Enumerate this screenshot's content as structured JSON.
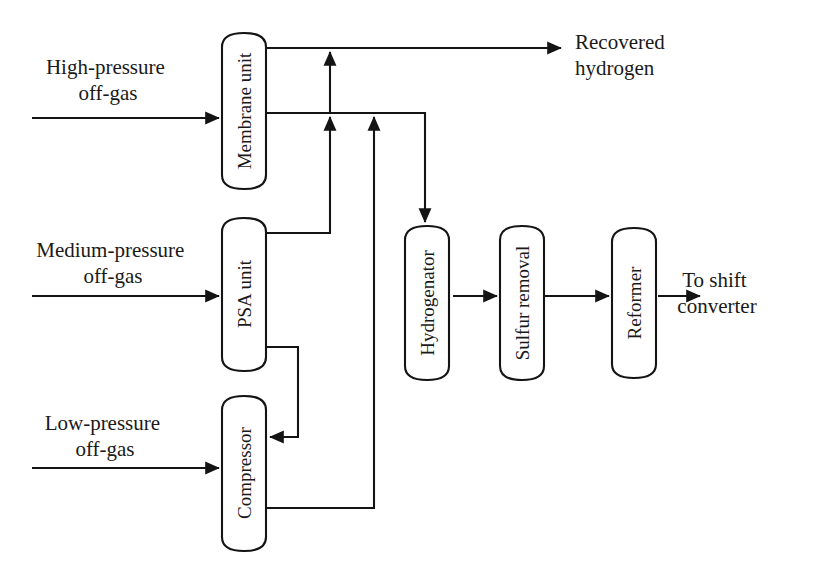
{
  "diagram": {
    "background_color": "#ffffff",
    "line_color": "#141414",
    "text_color": "#1a1a1a"
  },
  "vessels": [
    {
      "id": "membrane-unit",
      "label": "Membrane unit",
      "x": 222,
      "y": 33,
      "w": 44,
      "h": 156
    },
    {
      "id": "psa-unit",
      "label": "PSA unit",
      "x": 222,
      "y": 218,
      "w": 44,
      "h": 153
    },
    {
      "id": "compressor",
      "label": "Compressor",
      "x": 222,
      "y": 396,
      "w": 44,
      "h": 155
    },
    {
      "id": "hydrogenator",
      "label": "Hydrogenator",
      "x": 405,
      "y": 226,
      "w": 44,
      "h": 154
    },
    {
      "id": "sulfur-removal",
      "label": "Sulfur removal",
      "x": 500,
      "y": 226,
      "w": 44,
      "h": 154
    },
    {
      "id": "reformer",
      "label": "Reformer",
      "x": 612,
      "y": 228,
      "w": 44,
      "h": 150
    }
  ],
  "stream_labels": [
    {
      "id": "high-pressure-off-gas",
      "lines": [
        "High-pressure",
        "off-gas"
      ],
      "x": 108,
      "y": 74,
      "anchor": "middle"
    },
    {
      "id": "medium-pressure-off-gas",
      "lines": [
        "Medium-pressure",
        "off-gas"
      ],
      "x": 113,
      "y": 257,
      "anchor": "middle"
    },
    {
      "id": "low-pressure-off-gas",
      "lines": [
        "Low-pressure",
        "off-gas"
      ],
      "x": 105,
      "y": 430,
      "anchor": "middle"
    },
    {
      "id": "recovered-hydrogen",
      "lines": [
        "Recovered",
        "hydrogen"
      ],
      "x": 575,
      "y": 49,
      "anchor": "start"
    },
    {
      "id": "to-shift-converter",
      "lines": [
        "To shift",
        "converter"
      ],
      "x": 717,
      "y": 287,
      "anchor": "middle"
    }
  ],
  "connections": [
    {
      "id": "feed-high-pressure",
      "from": "High-pressure off-gas",
      "to": "Membrane unit"
    },
    {
      "id": "feed-medium-pressure",
      "from": "Medium-pressure off-gas",
      "to": "PSA unit"
    },
    {
      "id": "feed-low-pressure",
      "from": "Low-pressure off-gas",
      "to": "Compressor"
    },
    {
      "id": "membrane-to-recovered-h2",
      "from": "Membrane unit",
      "to": "Recovered hydrogen"
    },
    {
      "id": "membrane-to-hydrogenator",
      "from": "Membrane unit",
      "to": "Hydrogenator"
    },
    {
      "id": "riser-to-recovered-h2",
      "from": "Membrane permeate header",
      "to": "Recovered hydrogen header"
    },
    {
      "id": "psa-to-header",
      "from": "PSA unit",
      "to": "Hydrogenator header"
    },
    {
      "id": "psa-to-compressor",
      "from": "PSA unit",
      "to": "Compressor"
    },
    {
      "id": "compressor-to-header",
      "from": "Compressor",
      "to": "Hydrogenator header"
    },
    {
      "id": "hydrogenator-to-sulfur",
      "from": "Hydrogenator",
      "to": "Sulfur removal"
    },
    {
      "id": "sulfur-to-reformer",
      "from": "Sulfur removal",
      "to": "Reformer"
    },
    {
      "id": "reformer-to-shift",
      "from": "Reformer",
      "to": "To shift converter"
    }
  ]
}
